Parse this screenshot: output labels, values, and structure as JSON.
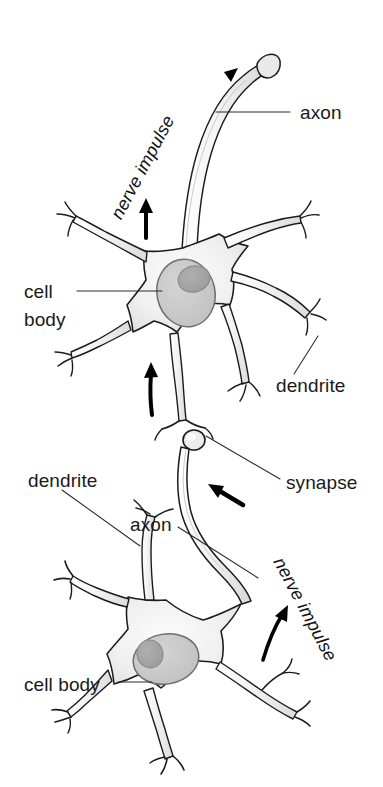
{
  "figure": {
    "background_color": "#ffffff",
    "width": 383,
    "height": 787
  },
  "colors": {
    "outline": "#1c1c1c",
    "cytoplasm_light": "#f4f4f4",
    "cytoplasm_mid": "#e4e4e4",
    "nucleus": "#c9c9c9",
    "nucleolus": "#a6a6a6",
    "text": "#1a1a1a",
    "leader_line": "#2a2a2a",
    "arrow": "#000000"
  },
  "labels": [
    {
      "id": "axon-top",
      "text": "axon",
      "style": "upright",
      "x": 300,
      "y": 113
    },
    {
      "id": "nerve-impulse-top",
      "text": "nerve impulse",
      "style": "italic",
      "x": 148,
      "y": 170,
      "rotation": -62
    },
    {
      "id": "cell-body-top",
      "text": "cell",
      "style": "upright",
      "x": 24,
      "y": 296
    },
    {
      "id": "cell-body-top-2",
      "text": "body",
      "style": "upright",
      "x": 24,
      "y": 322
    },
    {
      "id": "dendrite-right",
      "text": "dendrite",
      "style": "upright",
      "x": 276,
      "y": 388
    },
    {
      "id": "synapse",
      "text": "synapse",
      "style": "upright",
      "x": 286,
      "y": 485
    },
    {
      "id": "dendrite-left",
      "text": "dendrite",
      "style": "upright",
      "x": 28,
      "y": 483
    },
    {
      "id": "axon-bottom",
      "text": "axon",
      "style": "upright",
      "x": 130,
      "y": 527
    },
    {
      "id": "nerve-impulse-bottom",
      "text": "nerve impulse",
      "style": "italic",
      "x": 268,
      "y": 595,
      "rotation": 62
    },
    {
      "id": "cell-body-bottom",
      "text": "cell body",
      "style": "upright",
      "x": 24,
      "y": 688
    }
  ],
  "structures": {
    "upper_neuron": {
      "name": "upper neuron (postsynaptic)",
      "parts": [
        "cell body",
        "nucleus",
        "dendrites",
        "axon",
        "axon terminal"
      ],
      "dendrite_count": 5,
      "impulse_direction": "upward along axon toward axon terminal"
    },
    "lower_neuron": {
      "name": "lower neuron (presynaptic)",
      "parts": [
        "cell body",
        "nucleus",
        "dendrites",
        "axon",
        "synaptic terminal"
      ],
      "dendrite_count": 5,
      "impulse_direction": "upward along axon toward synapse"
    },
    "synapse": {
      "name": "synapse",
      "description": "junction where lower neuron axon terminal contacts upper neuron dendrite"
    }
  },
  "impulse_arrows": [
    {
      "id": "arrow-top-axon",
      "description": "impulse arrow near top axon terminal"
    },
    {
      "id": "arrow-upper-left",
      "description": "impulse arrow on upper neuron axon hillock"
    },
    {
      "id": "arrow-upper-lower",
      "description": "impulse arrow entering upper cell body from dendrite"
    },
    {
      "id": "arrow-synapse",
      "description": "impulse arrow approaching synapse"
    },
    {
      "id": "arrow-lower-axon",
      "description": "impulse arrow along lower neuron axon"
    }
  ]
}
